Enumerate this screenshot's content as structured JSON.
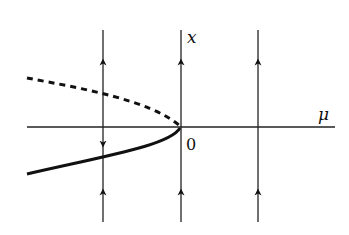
{
  "diagram": {
    "type": "saddle-node bifurcation diagram",
    "axes": {
      "horizontal_label": "μ",
      "vertical_label": "x",
      "origin_label": "0"
    },
    "branches": [
      {
        "name": "unstable",
        "style": "dashed",
        "region": "upper, μ < 0"
      },
      {
        "name": "stable",
        "style": "solid",
        "region": "lower, μ < 0"
      }
    ],
    "flow_lines": [
      {
        "position": "μ < 0",
        "arrows": [
          "up above unstable branch",
          "down between branches",
          "up below stable branch"
        ]
      },
      {
        "position": "μ = 0",
        "arrows": [
          "up",
          "up"
        ]
      },
      {
        "position": "μ > 0",
        "arrows": [
          "up",
          "up"
        ]
      }
    ],
    "colors": {
      "ink": "#111111",
      "background": "#ffffff"
    }
  }
}
